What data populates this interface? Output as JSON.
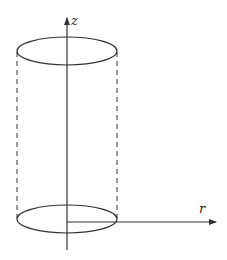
{
  "diagram": {
    "type": "cylinder-coordinates",
    "axes": {
      "z": {
        "label": "z",
        "direction": "up"
      },
      "r": {
        "label": "r",
        "direction": "right"
      }
    },
    "shapes": [
      {
        "name": "top-ellipse",
        "style": "solid"
      },
      {
        "name": "bottom-ellipse",
        "style": "solid"
      },
      {
        "name": "left-side",
        "style": "dashed"
      },
      {
        "name": "right-side",
        "style": "dashed"
      }
    ],
    "colors": {
      "stroke": "#333333",
      "background": "#ffffff"
    }
  }
}
